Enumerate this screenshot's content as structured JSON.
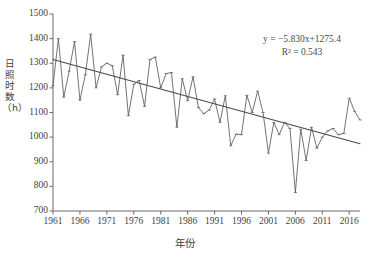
{
  "chart_data": {
    "type": "line",
    "title": "",
    "xlabel": "年份",
    "ylabel": "日照时数（h）",
    "ylabel_chars": [
      "日",
      "照",
      "时",
      "数",
      "（h）"
    ],
    "xlim": [
      1961,
      2018
    ],
    "ylim": [
      700,
      1500
    ],
    "yticks": [
      700,
      800,
      900,
      1000,
      1100,
      1200,
      1300,
      1400,
      1500
    ],
    "xticks": [
      1961,
      1966,
      1971,
      1976,
      1981,
      1986,
      1991,
      1996,
      2001,
      2006,
      2011,
      2016
    ],
    "grid": false,
    "legend": null,
    "annotations": {
      "equation": "y = −5.830x+1275.4",
      "r_squared": "R² = 0.543",
      "slope": -5.83,
      "intercept": 1275.4,
      "r2": 0.543
    },
    "series": [
      {
        "name": "日照时数",
        "color": "#5a5a5a",
        "x": [
          1961,
          1962,
          1963,
          1964,
          1965,
          1966,
          1967,
          1968,
          1969,
          1970,
          1971,
          1972,
          1973,
          1974,
          1975,
          1976,
          1977,
          1978,
          1979,
          1980,
          1981,
          1982,
          1983,
          1984,
          1985,
          1986,
          1987,
          1988,
          1989,
          1990,
          1991,
          1992,
          1993,
          1994,
          1995,
          1996,
          1997,
          1998,
          1999,
          2000,
          2001,
          2002,
          2003,
          2004,
          2005,
          2006,
          2007,
          2008,
          2009,
          2010,
          2011,
          2012,
          2013,
          2014,
          2015,
          2016,
          2017,
          2018
        ],
        "values": [
          1208,
          1400,
          1162,
          1268,
          1388,
          1150,
          1253,
          1418,
          1200,
          1285,
          1300,
          1290,
          1172,
          1333,
          1087,
          1215,
          1230,
          1125,
          1315,
          1325,
          1200,
          1258,
          1262,
          1040,
          1237,
          1148,
          1245,
          1120,
          1095,
          1110,
          1155,
          1060,
          1168,
          965,
          1012,
          1010,
          1170,
          1100,
          1187,
          1100,
          935,
          1060,
          1010,
          1060,
          1035,
          775,
          1032,
          905,
          1040,
          955,
          1000,
          1025,
          1035,
          1010,
          1015,
          1158,
          1105,
          1070
        ]
      },
      {
        "name": "线性趋势线",
        "type": "trend",
        "color": "#4a4a4a",
        "x": [
          1961,
          2018
        ],
        "values": [
          1315,
          973
        ]
      }
    ]
  },
  "axis": {
    "y_tick_labels": [
      "1500",
      "1400",
      "1300",
      "1200",
      "1100",
      "1000",
      "900",
      "800",
      "700"
    ],
    "x_tick_labels": [
      "1961",
      "1966",
      "1971",
      "1976",
      "1981",
      "1986",
      "1991",
      "1996",
      "2001",
      "2006",
      "2011",
      "2016"
    ]
  }
}
